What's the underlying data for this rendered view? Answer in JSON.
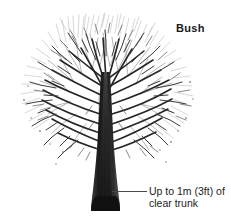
{
  "figure": {
    "background_color": "#ffffff",
    "ink_color": "#2b2b2b",
    "width": 231,
    "height": 224
  },
  "labels": {
    "form_label": "Bush",
    "callout_text": "Up to 1m (3ft) of\nclear trunk"
  },
  "annotations": {
    "leader_line_name": "leader-line"
  },
  "illustration": {
    "subject": "deciduous-tree-bare-branches",
    "trunk_name": "tree-trunk",
    "canopy_name": "tree-canopy",
    "canopy_top_y": 15,
    "trunk_base_y": 211,
    "trunk_base_left_x": 92,
    "trunk_base_right_x": 119,
    "canopy_left_x": 17,
    "canopy_right_x": 203
  }
}
